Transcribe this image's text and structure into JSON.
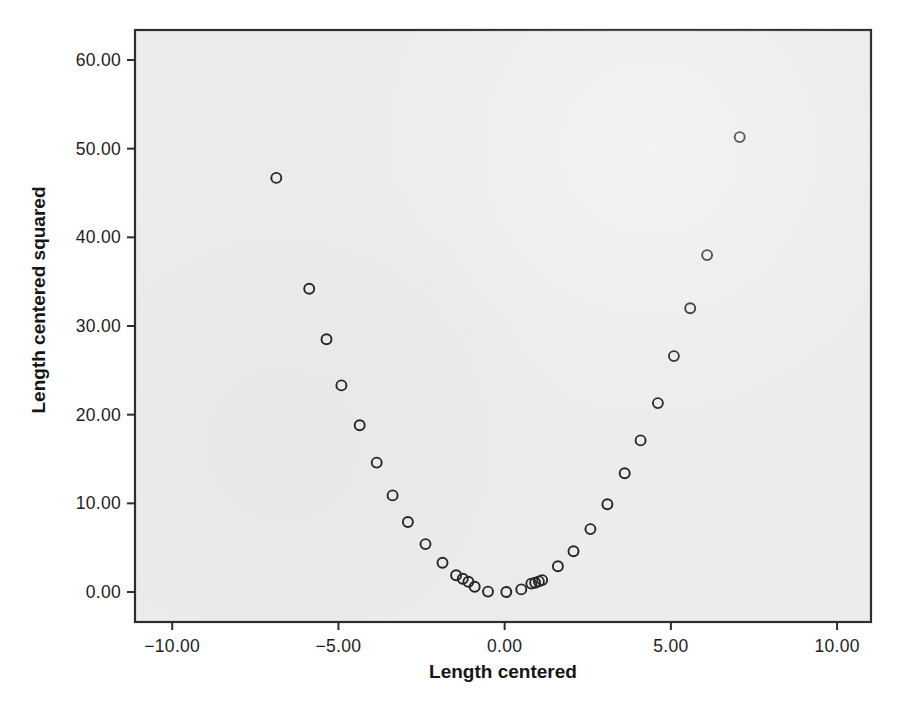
{
  "figure": {
    "background": "#ffffff",
    "plot_bg": "#ececea",
    "border_color": "#2e2e2e",
    "tick_color": "#2e2e2e",
    "marker_color": "#262626"
  },
  "chart_data": {
    "type": "scatter",
    "title": "",
    "xlabel": "Length centered",
    "ylabel": "Length centered squared",
    "xlim": [
      -11.12,
      11.02
    ],
    "ylim": [
      -3.38,
      63.38
    ],
    "grid": false,
    "legend": "none",
    "marker": "open-circle",
    "xticks": {
      "values": [
        -10,
        -5,
        0,
        5,
        10
      ],
      "labels": [
        "−10.00",
        "−5.00",
        "0.00",
        "5.00",
        "10.00"
      ]
    },
    "yticks": {
      "values": [
        0,
        10,
        20,
        30,
        40,
        50,
        60
      ],
      "labels": [
        "0.00",
        "10.00",
        "20.00",
        "30.00",
        "40.00",
        "50.00",
        "60.00"
      ]
    },
    "points": [
      [
        -6.87,
        46.7
      ],
      [
        -5.88,
        34.2
      ],
      [
        -5.36,
        28.5
      ],
      [
        -4.91,
        23.3
      ],
      [
        -4.36,
        18.8
      ],
      [
        -3.85,
        14.6
      ],
      [
        -3.37,
        10.9
      ],
      [
        -2.91,
        7.9
      ],
      [
        -2.38,
        5.4
      ],
      [
        -1.87,
        3.3
      ],
      [
        -1.46,
        1.9
      ],
      [
        -1.26,
        1.5
      ],
      [
        -1.09,
        1.15
      ],
      [
        -0.9,
        0.6
      ],
      [
        -0.5,
        0.05
      ],
      [
        0.05,
        0.0
      ],
      [
        0.5,
        0.3
      ],
      [
        0.8,
        0.95
      ],
      [
        0.92,
        1.05
      ],
      [
        1.03,
        1.2
      ],
      [
        1.13,
        1.35
      ],
      [
        1.6,
        2.9
      ],
      [
        2.07,
        4.6
      ],
      [
        2.58,
        7.1
      ],
      [
        3.09,
        9.9
      ],
      [
        3.61,
        13.4
      ],
      [
        4.09,
        17.1
      ],
      [
        4.61,
        21.3
      ],
      [
        5.09,
        26.6
      ],
      [
        5.58,
        32.0
      ],
      [
        6.09,
        38.0
      ],
      [
        7.07,
        51.3
      ]
    ]
  }
}
